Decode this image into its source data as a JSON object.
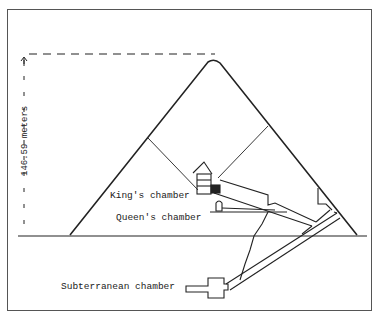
{
  "diagram": {
    "height_label": "146.59 meters",
    "labels": {
      "kings_chamber": "King's chamber",
      "queens_chamber": "Queen's chamber",
      "subterranean_chamber": "Subterranean chamber"
    },
    "colors": {
      "line": "#222222",
      "background": "#ffffff",
      "frame": "#555555"
    }
  }
}
